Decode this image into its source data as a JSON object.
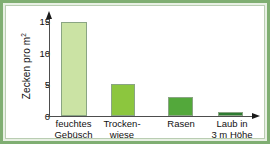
{
  "figure": {
    "frame_color": "#7fae72",
    "card_background": "#ffffff"
  },
  "axes": {
    "y_title_main": "Zecken pro m",
    "y_title_exponent": "2",
    "y_ticks": [
      "0",
      "5",
      "10",
      "15"
    ],
    "axis_color": "#4d4d4d"
  },
  "chart_data": {
    "type": "bar",
    "title": "",
    "xlabel": "",
    "ylabel": "Zecken pro m²",
    "ylim": [
      0,
      16
    ],
    "yticks": [
      0,
      5,
      10,
      15
    ],
    "grid": false,
    "legend": "none",
    "categories": [
      "feuchtes Gebüsch",
      "Trocken- wiese",
      "Rasen",
      "Laub in 3 m Höhe"
    ],
    "category_lines": [
      [
        "feuchtes",
        "Gebüsch"
      ],
      [
        "Trocken-",
        "wiese"
      ],
      [
        "Rasen",
        ""
      ],
      [
        "Laub in",
        "3 m Höhe"
      ]
    ],
    "values": [
      15.0,
      5.1,
      3.1,
      0.6
    ],
    "bar_colors": [
      "#cbe3a4",
      "#8cc63e",
      "#53a83b",
      "#2c7a30"
    ]
  }
}
